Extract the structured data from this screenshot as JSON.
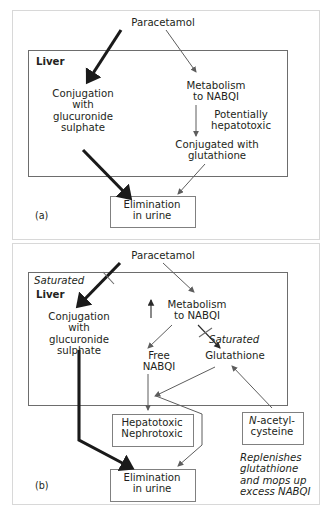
{
  "figure": {
    "panel_a": {
      "id_label": "(a)",
      "top_label": "Paracetamol",
      "liver_label": "Liver",
      "conjugation": "Conjugation\nwith\nglucuronide\nsulphate",
      "metabolism": "Metabolism\nto NABQI",
      "hepatotoxic_note": "Potentially\nhepatotoxic",
      "conjugated_glutathione": "Conjugated with\nglutathione",
      "elimination": "Elimination\nin urine"
    },
    "panel_b": {
      "id_label": "(b)",
      "top_label": "Paracetamol",
      "liver_label": "Liver",
      "saturated_left": "Saturated",
      "saturated_right": "Saturated",
      "conjugation": "Conjugation\nwith\nglucuronide\nsulphate",
      "metabolism": "Metabolism\nto NABQI",
      "increase_icon": "up-arrow-icon",
      "free_nabqi": "Free\nNABQI",
      "glutathione": "Glutathione",
      "toxicity_box": "Hepatotoxic\nNephrotoxic",
      "elimination": "Elimination\nin urine",
      "nac_box_italic_prefix": "N",
      "nac_box_rest": "-acetyl-\ncysteine",
      "nac_caption": "Replenishes\nglutathione\nand mops up\nexcess NABQI"
    }
  },
  "colors": {
    "text": "#231f20",
    "frame": "#d8d8d8",
    "box_border": "#808080",
    "liver_border": "#6d6d6d",
    "arrow_thin": "#5d5d5d",
    "arrow_thick": "#1a1a1a",
    "background": "#ffffff"
  }
}
